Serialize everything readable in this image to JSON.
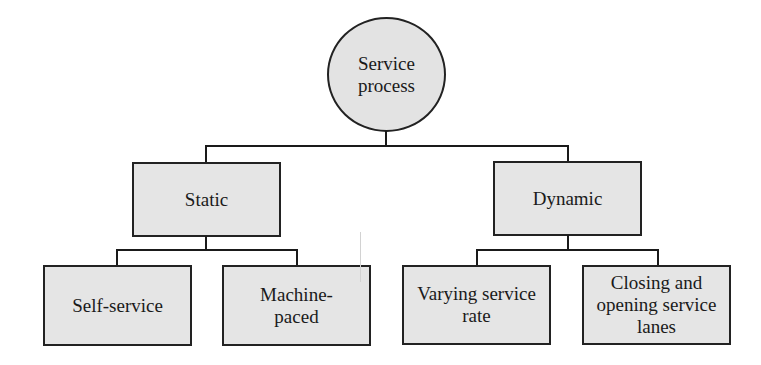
{
  "diagram": {
    "type": "hierarchy-tree",
    "colors": {
      "node_fill": "#e5e5e5",
      "node_border": "#222222",
      "connector": "#1a1a1a",
      "text": "#1a1a1a",
      "background": "#ffffff"
    },
    "root": {
      "label": "Service\nprocess",
      "shape": "circle"
    },
    "level1": [
      {
        "label": "Static",
        "children": [
          {
            "label": "Self-service"
          },
          {
            "label": "Machine-\npaced"
          }
        ]
      },
      {
        "label": "Dynamic",
        "children": [
          {
            "label": "Varying service\nrate"
          },
          {
            "label": "Closing and\nopening service\nlanes"
          }
        ]
      }
    ]
  }
}
